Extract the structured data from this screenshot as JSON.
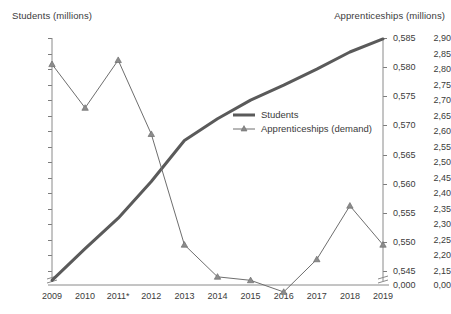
{
  "chart_data": {
    "type": "line",
    "title": "",
    "subtitle": "",
    "xlabel": "",
    "ylabel": "Students (millions)",
    "y2label": "Apprenticeships (millions)",
    "grid": false,
    "legend_position": "center-right inside plot",
    "x": [
      "2009",
      "2010",
      "2011*",
      "2012",
      "2013",
      "2014",
      "2015",
      "2016",
      "2017",
      "2018",
      "2019"
    ],
    "categories": [
      "2009",
      "2010",
      "2011*",
      "2012",
      "2013",
      "2014",
      "2015",
      "2016",
      "2017",
      "2018",
      "2019"
    ],
    "ylim": [
      2.15,
      2.9
    ],
    "y2lim": [
      0.545,
      0.585
    ],
    "y_ticks": [
      "0,00",
      "2,15",
      "2,20",
      "2,25",
      "2,30",
      "2,35",
      "2,40",
      "2,45",
      "2,50",
      "2,55",
      "2,60",
      "2,65",
      "2,70",
      "2,75",
      "2,80",
      "2,85",
      "2,90"
    ],
    "y2_ticks": [
      "0,000",
      "0,545",
      "0,550",
      "0,555",
      "0,560",
      "0,565",
      "0,570",
      "0,575",
      "0,580",
      "0,585"
    ],
    "y_axis_broken": true,
    "y2_axis_broken": true,
    "series": [
      {
        "name": "Students",
        "axis": "left",
        "style": "thick-line-no-marker",
        "color": "#5a5a5a",
        "values": [
          2.12,
          2.222,
          2.32,
          2.438,
          2.57,
          2.64,
          2.7,
          2.748,
          2.8,
          2.855,
          2.897
        ]
      },
      {
        "name": "Apprenticeships (demand)",
        "axis": "right",
        "style": "thin-line-triangle-marker",
        "color": "#6e6e6e",
        "values": [
          0.5805,
          0.573,
          0.5812,
          0.5685,
          0.5495,
          0.544,
          0.5434,
          0.5414,
          0.547,
          0.5562,
          0.5495
        ]
      }
    ],
    "annotations": [
      "2011*"
    ]
  },
  "axes": {
    "left_title": "Students (millions)",
    "right_title": "Apprenticeships (millions)"
  },
  "legend": {
    "items": [
      {
        "label": "Students"
      },
      {
        "label": "Apprenticeships (demand)"
      }
    ]
  },
  "colors": {
    "students_line": "#5a5a5a",
    "apprenticeships_line": "#6e6e6e",
    "axis": "#8a8a8a",
    "text": "#3b3b3b",
    "background": "#ffffff"
  }
}
